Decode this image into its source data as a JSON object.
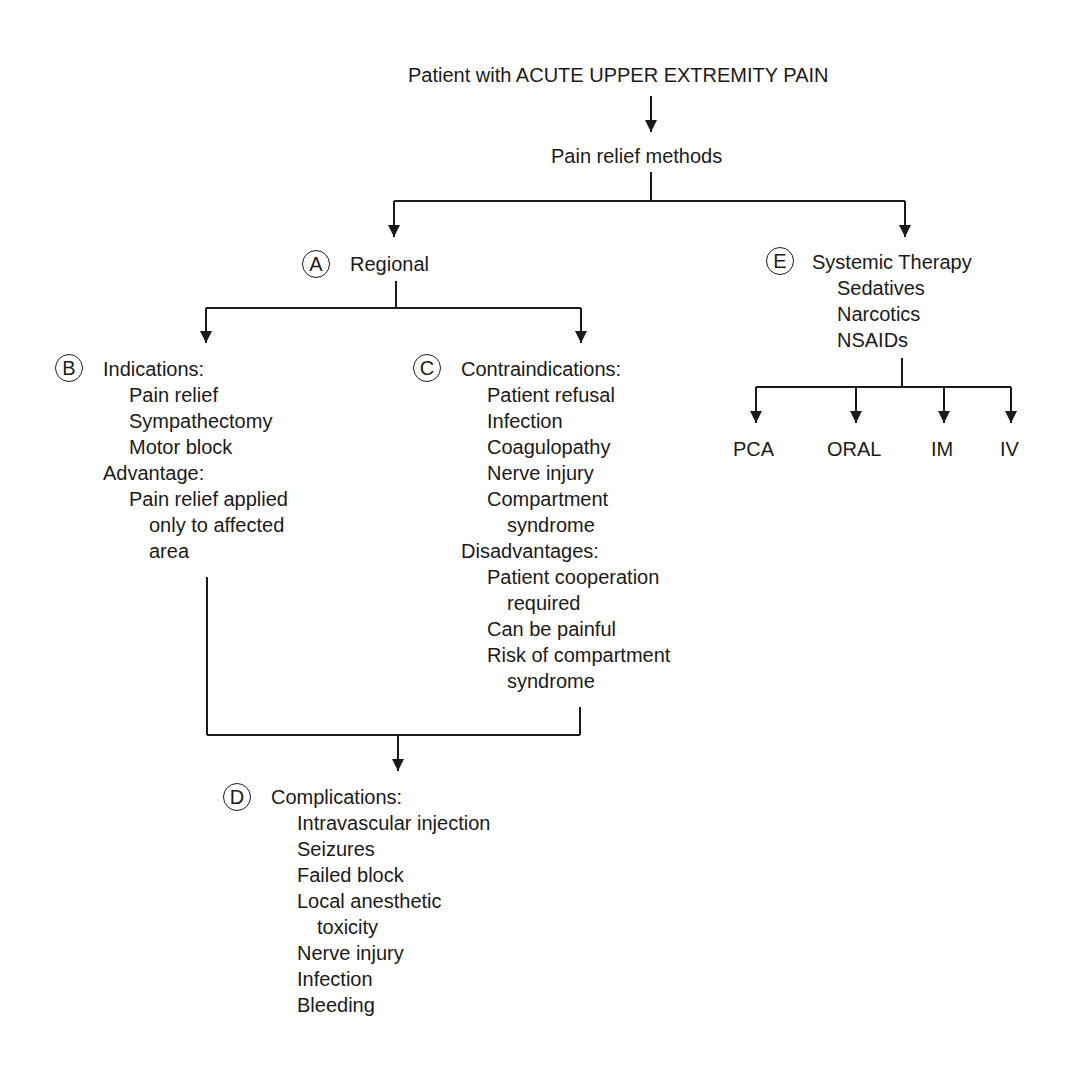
{
  "root": "Patient with ACUTE UPPER EXTREMITY PAIN",
  "methods": "Pain relief methods",
  "A": {
    "letter": "A",
    "title": "Regional"
  },
  "B": {
    "letter": "B",
    "title": "Indications:",
    "indications": [
      "Pain relief",
      "Sympathectomy",
      "Motor block"
    ],
    "advantage_title": "Advantage:",
    "advantage": [
      "Pain relief applied",
      "only to affected",
      "area"
    ]
  },
  "C": {
    "letter": "C",
    "title": "Contraindications:",
    "contraindications": [
      "Patient refusal",
      "Infection",
      "Coagulopathy",
      "Nerve injury",
      "Compartment",
      "syndrome"
    ],
    "disadvantages_title": "Disadvantages:",
    "disadvantages": [
      "Patient cooperation",
      "required",
      "Can be painful",
      "Risk of compartment",
      "syndrome"
    ]
  },
  "D": {
    "letter": "D",
    "title": "Complications:",
    "items": [
      "Intravascular injection",
      "Seizures",
      "Failed block",
      "Local anesthetic",
      "toxicity",
      "Nerve injury",
      "Infection",
      "Bleeding"
    ]
  },
  "E": {
    "letter": "E",
    "title": "Systemic Therapy",
    "items": [
      "Sedatives",
      "Narcotics",
      "NSAIDs"
    ],
    "routes": [
      "PCA",
      "ORAL",
      "IM",
      "IV"
    ]
  }
}
